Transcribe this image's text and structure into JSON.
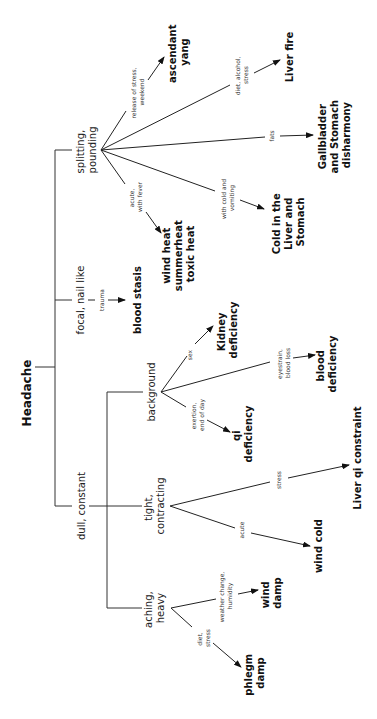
{
  "diagram": {
    "orientation": "rotated 90deg counter-clockwise",
    "root": "Headache",
    "branches": [
      {
        "label": "splitting, pounding",
        "lines": [
          "splitting,",
          "pounding"
        ],
        "outcomes": [
          {
            "condition": [
              "release of stress,",
              "weekend"
            ],
            "result": [
              "ascendant",
              "yang"
            ]
          },
          {
            "condition": [
              "diet, alcohol,",
              "stress"
            ],
            "result": [
              "Liver fire"
            ]
          },
          {
            "condition": [
              "fats"
            ],
            "result": [
              "Gallbladder",
              "and Stomach",
              "disharmony"
            ]
          },
          {
            "condition": [
              "with cold and",
              "vomiting"
            ],
            "result": [
              "Cold in the",
              "Liver and",
              "Stomach"
            ]
          },
          {
            "condition": [
              "acute,",
              "with fever"
            ],
            "result": [
              "wind heat",
              "summerheat",
              "toxic heat"
            ]
          }
        ]
      },
      {
        "label": "focal, nail like",
        "lines": [
          "focal, nail like"
        ],
        "outcomes": [
          {
            "condition": [
              "trauma"
            ],
            "result": [
              "blood stasis"
            ]
          }
        ]
      },
      {
        "label": "dull, constant",
        "lines": [
          "dull, constant"
        ],
        "sub": [
          {
            "label": "background",
            "lines": [
              "background"
            ],
            "outcomes": [
              {
                "condition": [
                  "sex"
                ],
                "result": [
                  "Kidney",
                  "deficiency"
                ]
              },
              {
                "condition": [
                  "eyestrain,",
                  "blood loss"
                ],
                "result": [
                  "blood",
                  "deficiency"
                ]
              },
              {
                "condition": [
                  "exertion,",
                  "end of day"
                ],
                "result": [
                  "qi",
                  "deficiency"
                ]
              }
            ]
          },
          {
            "label": "tight, contracting",
            "lines": [
              "tight,",
              "contracting"
            ],
            "outcomes": [
              {
                "condition": [
                  "stress"
                ],
                "result": [
                  "Liver qi constraint"
                ]
              },
              {
                "condition": [
                  "acute"
                ],
                "result": [
                  "wind cold"
                ]
              }
            ]
          },
          {
            "label": "aching, heavy",
            "lines": [
              "aching,",
              "heavy"
            ],
            "outcomes": [
              {
                "condition": [
                  "weather change,",
                  "humidity"
                ],
                "result": [
                  "wind",
                  "damp"
                ]
              },
              {
                "condition": [
                  "diet,",
                  "stress"
                ],
                "result": [
                  "phlegm",
                  "damp"
                ]
              }
            ]
          }
        ]
      }
    ]
  }
}
